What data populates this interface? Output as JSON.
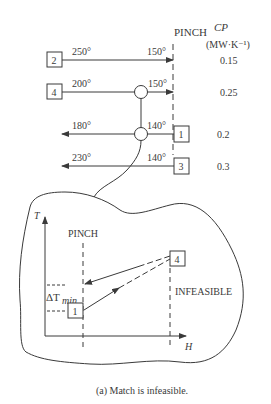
{
  "grid": {
    "pinch_label": "PINCH",
    "cp_header": "CP",
    "cp_units": "(MW·K⁻¹)",
    "streams": [
      {
        "id": "2",
        "start_temp": "250°",
        "end_temp": "150°",
        "cp": "0.15",
        "type": "hot"
      },
      {
        "id": "4",
        "start_temp": "200°",
        "end_temp": "150°",
        "cp": "0.25",
        "type": "hot"
      },
      {
        "id": "1",
        "start_temp": "140°",
        "end_temp": "180°",
        "cp": "0.2",
        "type": "cold"
      },
      {
        "id": "3",
        "start_temp": "140°",
        "end_temp": "230°",
        "cp": "0.3",
        "type": "cold"
      }
    ]
  },
  "inset": {
    "y_axis_label": "T",
    "x_axis_label": "H",
    "pinch_label": "PINCH",
    "infeasible_label": "INFEASIBLE",
    "dtmin_label": "ΔT",
    "dtmin_sub": "min",
    "box_hot": "4",
    "box_cold": "1"
  },
  "caption": "(a) Match is infeasible.",
  "colors": {
    "line": "#3a3a3a",
    "background": "#ffffff"
  }
}
